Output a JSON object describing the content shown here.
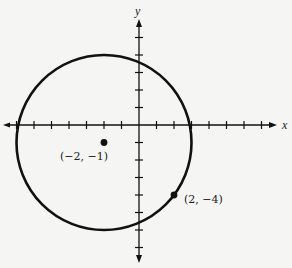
{
  "diagram": {
    "type": "coordinate-plane-circle",
    "axes": {
      "x_label": "x",
      "y_label": "y",
      "x_ticks": [
        -7,
        -6,
        -5,
        -4,
        -3,
        -2,
        -1,
        1,
        2,
        3,
        4,
        5,
        6,
        7
      ],
      "y_ticks": [
        5,
        4,
        3,
        2,
        1,
        -1,
        -2,
        -3,
        -4,
        -5,
        -6,
        -7
      ]
    },
    "circle": {
      "center": [
        -2,
        -1
      ],
      "radius": 5,
      "stroke_color": "#111111"
    },
    "points": [
      {
        "label": "(−2, −1)",
        "x": -2,
        "y": -1,
        "role": "center"
      },
      {
        "label": "(2, −4)",
        "x": 2,
        "y": -4,
        "role": "point-on-circle"
      }
    ],
    "colors": {
      "background": "#f5f5f4",
      "ink": "#111111"
    }
  }
}
